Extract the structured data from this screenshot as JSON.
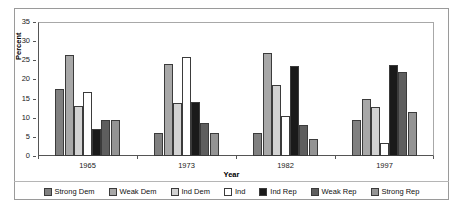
{
  "chart_data": {
    "type": "bar",
    "title": "",
    "xlabel": "Year",
    "ylabel": "Percent",
    "categories": [
      "1965",
      "1973",
      "1982",
      "1997"
    ],
    "ylim": [
      0,
      35
    ],
    "yticks": [
      0,
      5,
      10,
      15,
      20,
      25,
      30,
      35
    ],
    "grid": false,
    "legend_position": "bottom",
    "series": [
      {
        "name": "Strong Dem",
        "color": "#808080",
        "values": [
          17.5,
          6.0,
          6.0,
          9.5
        ]
      },
      {
        "name": "Weak Dem",
        "color": "#a8a8a8",
        "values": [
          26.5,
          24.0,
          27.0,
          15.0
        ]
      },
      {
        "name": "Ind Dem",
        "color": "#d2d2d2",
        "values": [
          13.0,
          13.8,
          18.5,
          12.8
        ]
      },
      {
        "name": "Ind",
        "color": "#ffffff",
        "values": [
          16.8,
          25.8,
          10.5,
          3.5
        ]
      },
      {
        "name": "Ind Rep",
        "color": "#1a1a1a",
        "values": [
          7.0,
          14.0,
          23.5,
          23.8
        ]
      },
      {
        "name": "Weak Rep",
        "color": "#5e5e5e",
        "values": [
          9.5,
          8.5,
          8.0,
          22.0
        ]
      },
      {
        "name": "Strong Rep",
        "color": "#949494",
        "values": [
          9.5,
          6.0,
          4.5,
          11.5
        ]
      }
    ]
  },
  "axes": {
    "y_title": "Percent",
    "x_title": "Year",
    "y_tick_labels": [
      "0",
      "5",
      "10",
      "15",
      "20",
      "25",
      "30",
      "35"
    ],
    "x_tick_labels": [
      "1965",
      "1973",
      "1982",
      "1997"
    ]
  },
  "legend": {
    "items": [
      {
        "label": "Strong Dem",
        "color": "#808080"
      },
      {
        "label": "Weak Dem",
        "color": "#a8a8a8"
      },
      {
        "label": "Ind Dem",
        "color": "#d2d2d2"
      },
      {
        "label": "Ind",
        "color": "#ffffff"
      },
      {
        "label": "Ind Rep",
        "color": "#1a1a1a"
      },
      {
        "label": "Weak Rep",
        "color": "#5e5e5e"
      },
      {
        "label": "Strong Rep",
        "color": "#949494"
      }
    ]
  }
}
